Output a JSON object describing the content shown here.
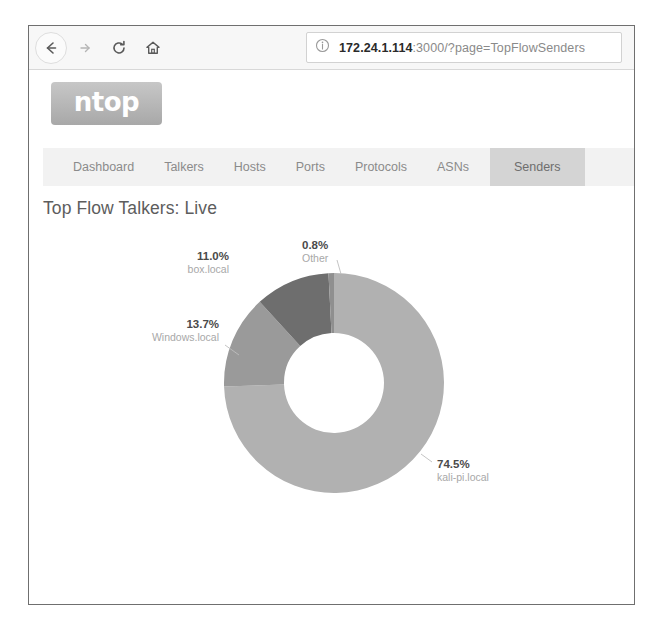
{
  "browser": {
    "back_icon": "back-arrow-icon",
    "forward_icon": "forward-arrow-icon",
    "reload_icon": "reload-icon",
    "home_icon": "home-icon",
    "url_info_icon": "info-circle-icon",
    "url_host": "172.24.1.114",
    "url_rest": ":3000/?page=TopFlowSenders",
    "url_full": "172.24.1.114:3000/?page=TopFlowSenders"
  },
  "app": {
    "logo_text": "ntop",
    "logo_color": "#b9b9b9"
  },
  "nav": {
    "tabs": [
      {
        "label": "Dashboard",
        "active": false
      },
      {
        "label": "Talkers",
        "active": false
      },
      {
        "label": "Hosts",
        "active": false
      },
      {
        "label": "Ports",
        "active": false
      },
      {
        "label": "Protocols",
        "active": false
      },
      {
        "label": "ASNs",
        "active": false
      },
      {
        "label": "Senders",
        "active": true
      }
    ],
    "active_tab": "Senders"
  },
  "main": {
    "title": "Top Flow Talkers: Live"
  },
  "chart_data": {
    "type": "pie",
    "variant": "donut",
    "title": "Top Flow Talkers: Live",
    "xlabel": "",
    "ylabel": "",
    "legend": "none",
    "labels": [
      "kali-pi.local",
      "Windows.local",
      "box.local",
      "Other"
    ],
    "values": [
      74.5,
      13.7,
      11.0,
      0.8
    ],
    "unit": "%",
    "colors": [
      "#b1b1b1",
      "#9a9a9a",
      "#6e6e6e",
      "#8f8f8f"
    ],
    "slices": [
      {
        "name": "kali-pi.local",
        "value": 74.5,
        "pct_label": "74.5%",
        "color": "#b1b1b1"
      },
      {
        "name": "Windows.local",
        "value": 13.7,
        "pct_label": "13.7%",
        "color": "#9a9a9a"
      },
      {
        "name": "box.local",
        "value": 11.0,
        "pct_label": "11.0%",
        "color": "#6e6e6e"
      },
      {
        "name": "Other",
        "value": 0.8,
        "pct_label": "0.8%",
        "color": "#8f8f8f"
      }
    ]
  }
}
